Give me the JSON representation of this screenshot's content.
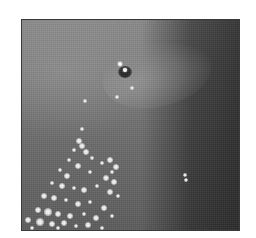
{
  "image": {
    "description": "Grayscale photograph: dark mottled surface with a small dark pit and lighter halo near top-center, scattered bright speckles concentrated in lower-left",
    "colors": {
      "background": "#ffffff",
      "surface_light": "#8a8a8a",
      "surface_dark": "#2a2a2a",
      "speckle": "#ffffff",
      "pit": "#1a1a1a"
    },
    "frame": {
      "x": 21,
      "y": 19,
      "width": 219,
      "height": 212
    },
    "pit": {
      "x": 103,
      "y": 52
    },
    "glints": [
      {
        "x": 98,
        "y": 44
      },
      {
        "x": 103,
        "y": 50
      }
    ],
    "speckles": [
      {
        "x": 110,
        "y": 68,
        "r": 2
      },
      {
        "x": 63,
        "y": 81,
        "r": 2
      },
      {
        "x": 95,
        "y": 77,
        "r": 2
      },
      {
        "x": 60,
        "y": 109,
        "r": 2
      },
      {
        "x": 57,
        "y": 121,
        "r": 3
      },
      {
        "x": 60,
        "y": 126,
        "r": 3
      },
      {
        "x": 52,
        "y": 130,
        "r": 2
      },
      {
        "x": 64,
        "y": 132,
        "r": 3
      },
      {
        "x": 70,
        "y": 138,
        "r": 2
      },
      {
        "x": 47,
        "y": 140,
        "r": 2
      },
      {
        "x": 56,
        "y": 146,
        "r": 3
      },
      {
        "x": 80,
        "y": 143,
        "r": 2
      },
      {
        "x": 88,
        "y": 140,
        "r": 3
      },
      {
        "x": 94,
        "y": 147,
        "r": 3
      },
      {
        "x": 90,
        "y": 152,
        "r": 2
      },
      {
        "x": 38,
        "y": 150,
        "r": 2
      },
      {
        "x": 45,
        "y": 156,
        "r": 3
      },
      {
        "x": 68,
        "y": 152,
        "r": 2
      },
      {
        "x": 84,
        "y": 158,
        "r": 3
      },
      {
        "x": 92,
        "y": 162,
        "r": 3
      },
      {
        "x": 30,
        "y": 163,
        "r": 2
      },
      {
        "x": 40,
        "y": 166,
        "r": 3
      },
      {
        "x": 52,
        "y": 168,
        "r": 2
      },
      {
        "x": 62,
        "y": 170,
        "r": 3
      },
      {
        "x": 75,
        "y": 166,
        "r": 2
      },
      {
        "x": 88,
        "y": 172,
        "r": 3
      },
      {
        "x": 96,
        "y": 176,
        "r": 2
      },
      {
        "x": 22,
        "y": 176,
        "r": 3
      },
      {
        "x": 32,
        "y": 178,
        "r": 3
      },
      {
        "x": 44,
        "y": 180,
        "r": 2
      },
      {
        "x": 56,
        "y": 184,
        "r": 3
      },
      {
        "x": 68,
        "y": 182,
        "r": 2
      },
      {
        "x": 82,
        "y": 188,
        "r": 3
      },
      {
        "x": 16,
        "y": 190,
        "r": 3
      },
      {
        "x": 26,
        "y": 192,
        "r": 4
      },
      {
        "x": 36,
        "y": 194,
        "r": 3
      },
      {
        "x": 48,
        "y": 196,
        "r": 3
      },
      {
        "x": 62,
        "y": 194,
        "r": 2
      },
      {
        "x": 74,
        "y": 198,
        "r": 3
      },
      {
        "x": 90,
        "y": 196,
        "r": 2
      },
      {
        "x": 6,
        "y": 200,
        "r": 3
      },
      {
        "x": 18,
        "y": 202,
        "r": 4
      },
      {
        "x": 30,
        "y": 204,
        "r": 3
      },
      {
        "x": 42,
        "y": 203,
        "r": 3
      },
      {
        "x": 54,
        "y": 206,
        "r": 2
      },
      {
        "x": 66,
        "y": 205,
        "r": 3
      },
      {
        "x": 10,
        "y": 208,
        "r": 2
      },
      {
        "x": 36,
        "y": 208,
        "r": 2
      },
      {
        "x": 80,
        "y": 208,
        "r": 2
      },
      {
        "x": 163,
        "y": 155,
        "r": 2
      },
      {
        "x": 164,
        "y": 160,
        "r": 2
      }
    ]
  }
}
